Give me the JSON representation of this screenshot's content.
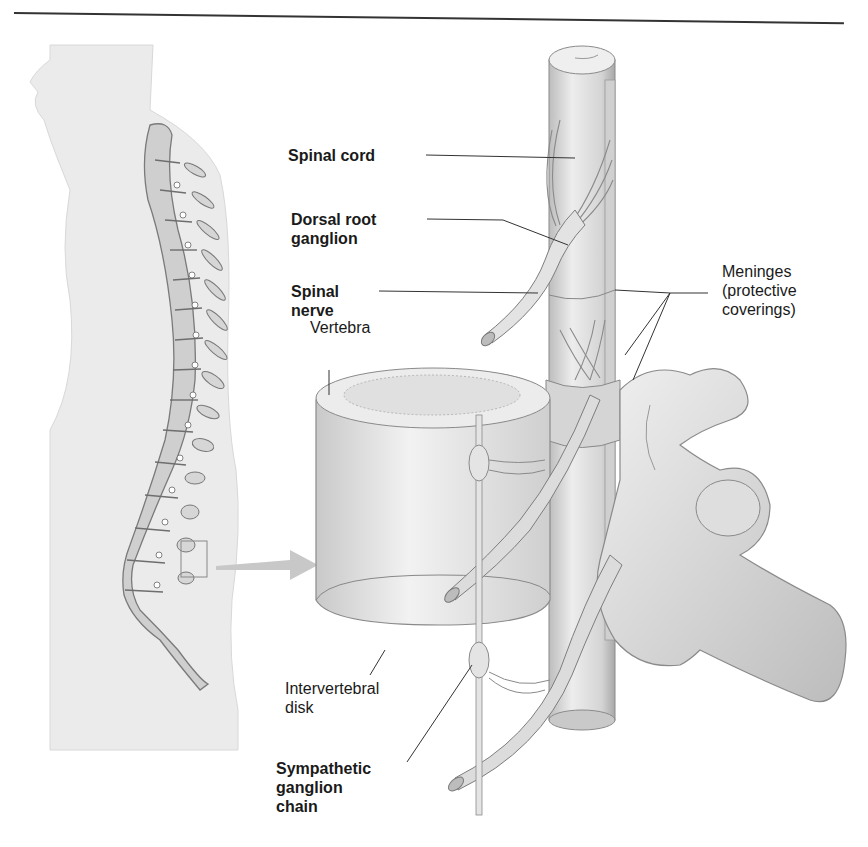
{
  "figure": {
    "type": "anatomical-diagram",
    "inset": "Side view of human body outline with vertebral column; box on lower spine with arrow to enlarged view"
  },
  "labels": {
    "spinal_cord": "Spinal cord",
    "dorsal_root_ganglion": "Dorsal root\nganglion",
    "spinal_nerve": "Spinal\nnerve",
    "vertebra": "Vertebra",
    "meninges": "Meninges\n(protective\ncoverings)",
    "intervertebral_disk": "Intervertebral\ndisk",
    "sympathetic_ganglion_chain": "Sympathetic\nganglion\nchain"
  },
  "colors": {
    "line": "#333333",
    "body_fill": "#ececec",
    "bone_fill": "#d9d9d9",
    "bone_stroke": "#8a8a8a",
    "text": "#1a1a1a",
    "arrow": "#c8c8c8"
  }
}
